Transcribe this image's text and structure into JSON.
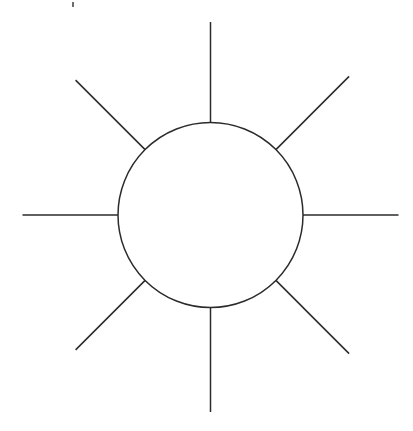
{
  "document": {
    "title": "Sun Diagram",
    "background_color": "#ffffff",
    "width": 413,
    "height": 431,
    "description": "Line drawing of a sun: an open circle with eight straight rays radiating outward"
  },
  "figure": {
    "name": "sun-symbol",
    "stroke_color": "#2b2b2b",
    "stroke_width": 1.5,
    "fill_color": "none",
    "center": {
      "x": 210.5,
      "y": 215.0
    },
    "circle": {
      "label": "sun-disc",
      "radius": 92.5
    },
    "rays": [
      {
        "label": "ray-north",
        "angle_deg": 90,
        "inner_radius": 92.5,
        "outer_radius": 193.0,
        "x1": 210.5,
        "y1": 122.5,
        "x2": 210.5,
        "y2": 22.0
      },
      {
        "label": "ray-northeast",
        "angle_deg": 45,
        "inner_radius": 92.5,
        "outer_radius": 196.0,
        "x1": 275.9,
        "y1": 149.6,
        "x2": 349.1,
        "y2": 76.4
      },
      {
        "label": "ray-east",
        "angle_deg": 0,
        "inner_radius": 92.5,
        "outer_radius": 188.0,
        "x1": 303.0,
        "y1": 215.0,
        "x2": 398.5,
        "y2": 215.0
      },
      {
        "label": "ray-southeast",
        "angle_deg": -45,
        "inner_radius": 92.5,
        "outer_radius": 196.0,
        "x1": 275.9,
        "y1": 280.4,
        "x2": 349.1,
        "y2": 353.6
      },
      {
        "label": "ray-south",
        "angle_deg": -90,
        "inner_radius": 92.5,
        "outer_radius": 197.0,
        "x1": 210.5,
        "y1": 307.5,
        "x2": 210.5,
        "y2": 412.0
      },
      {
        "label": "ray-southwest",
        "angle_deg": -135,
        "inner_radius": 92.5,
        "outer_radius": 190.0,
        "x1": 145.1,
        "y1": 280.4,
        "x2": 75.6,
        "y2": 349.9
      },
      {
        "label": "ray-west",
        "angle_deg": 180,
        "inner_radius": 92.5,
        "outer_radius": 188.0,
        "x1": 118.0,
        "y1": 215.0,
        "x2": 22.5,
        "y2": 215.0
      },
      {
        "label": "ray-northwest",
        "angle_deg": 135,
        "inner_radius": 92.5,
        "outer_radius": 190.0,
        "x1": 145.1,
        "y1": 149.6,
        "x2": 75.6,
        "y2": 80.1
      }
    ],
    "artifacts": [
      {
        "label": "stray-ink-mark",
        "x": 72.0,
        "y": 2.0,
        "width": 2.0,
        "height": 5.0,
        "color": "#6d6d6d"
      }
    ]
  }
}
